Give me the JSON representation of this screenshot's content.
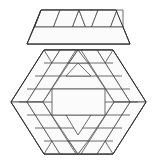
{
  "figure": {
    "kind": "geometric-tiling-puzzle",
    "canvas": {
      "width": 157,
      "height": 162
    },
    "colors": {
      "background": "#ffffff",
      "tile_fill": "#fbfbfb",
      "tile_stroke": "#4a4a4a",
      "outline_stroke": "#2e2e2e"
    },
    "line_width": 0.8,
    "outline_width": 1.0,
    "parts": [
      {
        "name": "lid",
        "label": "detached trapezoid lid",
        "piece_count": 9
      },
      {
        "name": "body",
        "label": "hexagon body",
        "piece_count": 36
      }
    ]
  },
  "lid": {
    "name": "trapezoid-lid",
    "outline": "27,44 41,10 116,10 130,44",
    "pieces": [
      "27,44 41,10 66,10 52,44",
      "41,10 66,10 52,44",
      "52,44 66,10 91,10 77,44",
      "66,10 91,10 77,44",
      "77,44 91,10 116,10 102,44",
      "91,10 116,10 102,44",
      "102,44 116,10 130,44",
      "27,44 130,44 130,28 27,28",
      "41,10 116,10 116,28 41,28"
    ],
    "rows": [
      {
        "y_top": 10,
        "y_bottom": 28,
        "cells": 8
      },
      {
        "y_top": 28,
        "y_bottom": 44,
        "cells": 1
      }
    ]
  },
  "body": {
    "name": "hexagon-body",
    "outline": "11,102 44,50 113,50 146,102 113,154 44,154",
    "vertices": [
      {
        "id": "left-top",
        "x": 11,
        "y": 102
      },
      {
        "id": "top-left",
        "x": 44,
        "y": 50
      },
      {
        "id": "top-right",
        "x": 113,
        "y": 50
      },
      {
        "id": "right-top",
        "x": 146,
        "y": 102
      },
      {
        "id": "bottom-right",
        "x": 113,
        "y": 154
      },
      {
        "id": "bottom-left",
        "x": 44,
        "y": 154
      }
    ],
    "rings": [
      {
        "id": "ring-outer",
        "inset": 0
      },
      {
        "id": "ring-middle",
        "inset": 1
      },
      {
        "id": "ring-inner",
        "inset": 2
      },
      {
        "id": "ring-core",
        "inset": 3
      }
    ],
    "pieces": [
      "44,50 61,50 28,102 11,102",
      "11,102 28,102 61,154 44,154",
      "96,50 113,50 146,102 129,102",
      "129,102 146,102 113,154 96,154",
      "61,50 96,50 79,76 44,76",
      "44,76 79,76 62,102 27,102",
      "61,154 96,154 79,128 44,128",
      "44,128 79,128 62,102 27,102",
      "78,50 96,50 79,76",
      "61,50 78,50 79,76",
      "78,154 96,154 79,128",
      "61,154 78,154 79,128",
      "61,50 78,50 61,76",
      "96,50 113,50 96,76",
      "61,154 78,154 61,128",
      "96,154 113,154 96,128",
      "28,102 44,76 44,128",
      "129,102 113,76 113,128",
      "61,76 96,76 79,102 44,102",
      "61,128 96,128 79,102 44,102",
      "70,76 87,76 79,90",
      "70,128 87,128 79,114",
      "61,90 96,90 96,102 61,102",
      "61,102 96,102 96,114 61,114",
      "44,63 113,63 113,76 44,76",
      "44,141 113,141 113,128 44,128",
      "27,89 44,89 44,102 27,102",
      "27,115 44,115 44,102 27,102",
      "113,89 130,89 130,102 113,102",
      "113,115 130,115 130,102 113,102",
      "44,50 113,50 113,63 44,63",
      "44,154 113,154 113,141 44,141"
    ],
    "guides": [
      {
        "from": [
          44,
          50
        ],
        "to": [
          11,
          102
        ]
      },
      {
        "from": [
          11,
          102
        ],
        "to": [
          44,
          154
        ]
      },
      {
        "from": [
          113,
          50
        ],
        "to": [
          146,
          102
        ]
      },
      {
        "from": [
          146,
          102
        ],
        "to": [
          113,
          154
        ]
      },
      {
        "from": [
          44,
          50
        ],
        "to": [
          113,
          50
        ]
      },
      {
        "from": [
          44,
          154
        ],
        "to": [
          113,
          154
        ]
      }
    ]
  }
}
